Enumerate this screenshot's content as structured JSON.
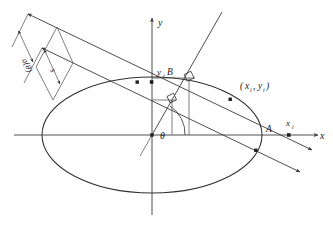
{
  "figure": {
    "kind": "geometry-diagram",
    "background_color": "#ffffff",
    "stroke_color": "#3a3a3a"
  },
  "axes": {
    "x_axis_label": "x",
    "y_axis_label": "y",
    "x_tick_label": "x",
    "x_tick_sub": "i",
    "y_tick_label": "y",
    "y_tick_sub": "i",
    "origin_label": ""
  },
  "angle": {
    "symbol": "θ",
    "name": "theta"
  },
  "measures": [
    {
      "id": "a-theta",
      "label": "a(θ)",
      "orientation": "rotated",
      "description": "outer double-headed dimension arrow"
    },
    {
      "id": "s",
      "label": "s",
      "orientation": "rotated",
      "description": "inner double-headed dimension arrow"
    }
  ],
  "points": [
    {
      "id": "A",
      "label": "A",
      "description": "intersection of ellipse with positive x-axis region"
    },
    {
      "id": "B",
      "label": "B",
      "description": "projection point on upper horizontal helper line"
    },
    {
      "id": "P",
      "label": "(x , y )",
      "label_main": "(",
      "description": "point on ellipse boundary"
    }
  ],
  "point_coordinate_label": {
    "open": "(",
    "x_var": "x",
    "x_sub": "i",
    "comma": ",",
    "y_var": "y",
    "y_sub": "i",
    "close": ")"
  },
  "caption": {
    "text": "",
    "visible": false
  }
}
